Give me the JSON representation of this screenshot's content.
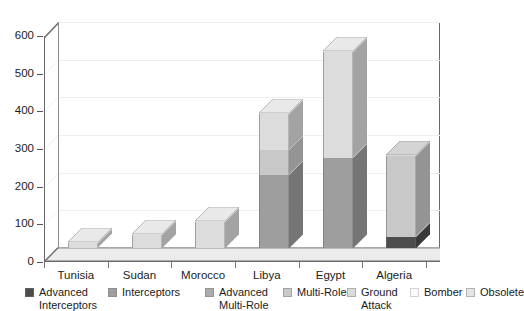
{
  "chart_data": {
    "type": "bar",
    "subtype": "stacked-3d-column",
    "title": "",
    "subtitle": "",
    "xlabel": "",
    "ylabel": "",
    "categories": [
      "Tunisia",
      "Sudan",
      "Morocco",
      "Libya",
      "Egypt",
      "Algeria"
    ],
    "ylim": [
      0,
      600
    ],
    "yticks": [
      0,
      100,
      200,
      300,
      400,
      500,
      600
    ],
    "ytick_labels": [
      "0",
      "100",
      "200",
      "300",
      "400",
      "500",
      "600"
    ],
    "grid": true,
    "legend_position": "bottom",
    "series": [
      {
        "name": "Advanced Interceptors",
        "color": "#4d4d4d",
        "values": [
          0,
          0,
          0,
          0,
          0,
          30
        ]
      },
      {
        "name": "Interceptors",
        "color": "#9e9e9e",
        "values": [
          0,
          0,
          0,
          195,
          240,
          0
        ]
      },
      {
        "name": "Advanced Multi-Role",
        "color": "#ababab",
        "values": [
          0,
          0,
          0,
          0,
          0,
          0
        ]
      },
      {
        "name": "Multi-Role",
        "color": "#c8c8c8",
        "values": [
          0,
          0,
          0,
          65,
          0,
          213
        ]
      },
      {
        "name": "Ground Attack",
        "color": "#dcdcdc",
        "values": [
          12,
          35,
          70,
          95,
          280,
          0
        ]
      },
      {
        "name": "Bomber",
        "color": "#f2f2f2",
        "values": [
          0,
          0,
          0,
          0,
          0,
          0
        ]
      },
      {
        "name": "Obsolete",
        "color": "#e4e4e4",
        "values": [
          0,
          0,
          0,
          0,
          0,
          0
        ]
      }
    ],
    "totals": [
      12,
      35,
      70,
      355,
      520,
      243
    ]
  },
  "legend": {
    "items": [
      {
        "label": "Advanced\nInterceptors",
        "color": "#4d4d4d"
      },
      {
        "label": "Interceptors",
        "color": "#9e9e9e"
      },
      {
        "label": "Advanced\nMulti-Role",
        "color": "#ababab"
      },
      {
        "label": "Multi-Role",
        "color": "#c8c8c8"
      },
      {
        "label": "Ground\nAttack",
        "color": "#dcdcdc"
      },
      {
        "label": "Bomber",
        "color": "#fbfbfb"
      },
      {
        "label": "Obsolete",
        "color": "#e4e4e4"
      }
    ]
  },
  "axes": {
    "y_labels": [
      "600",
      "500",
      "400",
      "300",
      "200",
      "100",
      "0"
    ],
    "x_labels": [
      "Tunisia",
      "Sudan",
      "Morocco",
      "Libya",
      "Egypt",
      "Algeria"
    ]
  }
}
